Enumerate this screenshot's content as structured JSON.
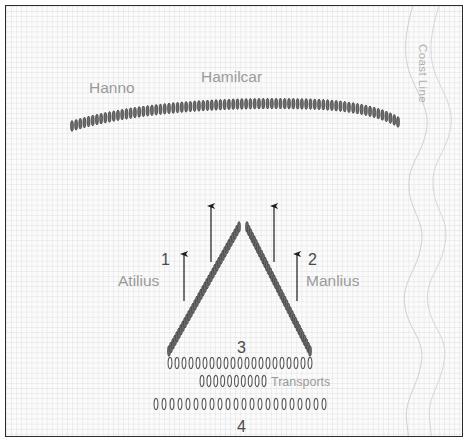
{
  "diagram": {
    "background_color": "#fbfbfb",
    "border_color": "#2c2c2c",
    "ship_color": "#555555",
    "label_color": "#9a9a9a",
    "number_color": "#4a4a4a",
    "grid": "faint square graph paper"
  },
  "labels": {
    "hanno": "Hanno",
    "hamilcar": "Hamilcar",
    "atilius": "Atilius",
    "manlius": "Manlius",
    "transports": "Transports",
    "coast_line": "Coast Line",
    "squadron_1": "1",
    "squadron_2": "2",
    "squadron_3": "3",
    "squadron_4": "4"
  },
  "chart_data": {
    "type": "diagram",
    "formations": [
      {
        "name": "Hamilcar",
        "role": "enemy-line",
        "shape": "arc",
        "ship_count": 78,
        "path": "M 66,120 C 130,101 220,96 300,98 C 345,99 375,106 392,116"
      },
      {
        "name": "Atilius-Manlius-wedge",
        "role": "wedge-left-arm",
        "shape": "line",
        "ship_count": 36,
        "path": "M 163,345 L 233,221"
      },
      {
        "name": "Atilius-Manlius-wedge",
        "role": "wedge-right-arm",
        "shape": "line",
        "ship_count": 36,
        "path": "M 241,221 L 304,345"
      },
      {
        "name": "squadron-3",
        "role": "third-line",
        "shape": "horizontal-row",
        "ship_count": 21,
        "y": 357,
        "x_start": 164,
        "x_end": 304
      },
      {
        "name": "transports",
        "role": "transport-row",
        "shape": "horizontal-row",
        "ship_count": 10,
        "y": 375,
        "x_start": 196,
        "x_end": 258
      },
      {
        "name": "squadron-4",
        "role": "fourth-line",
        "shape": "horizontal-row",
        "ship_count": 22,
        "y": 398,
        "x_start": 150,
        "x_end": 318
      }
    ],
    "arrows": [
      {
        "name": "arrow-1",
        "x": 178,
        "y_tail": 295,
        "y_head": 248
      },
      {
        "name": "arrow-center-left",
        "x": 205,
        "y_tail": 256,
        "y_head": 200
      },
      {
        "name": "arrow-center-right",
        "x": 268,
        "y_tail": 256,
        "y_head": 200
      },
      {
        "name": "arrow-2",
        "x": 291,
        "y_tail": 295,
        "y_head": 248
      }
    ],
    "coast": {
      "label": "Coast Line",
      "inner_path": "M 408,0 C 399,26 396,48 404,70 C 412,92 424,104 420,126 C 416,148 402,158 404,182 C 406,206 420,216 416,240 C 412,264 396,276 400,300 C 404,324 420,334 416,358 C 412,382 398,394 402,418 L 404,432",
      "outer_path": "M 432,0 C 424,24 420,46 428,68 C 436,90 446,102 442,124 C 438,146 424,156 426,180 C 428,204 442,214 438,238 C 434,262 418,274 422,298 C 426,322 442,332 438,356 C 434,380 420,392 424,416 L 426,432"
    }
  }
}
